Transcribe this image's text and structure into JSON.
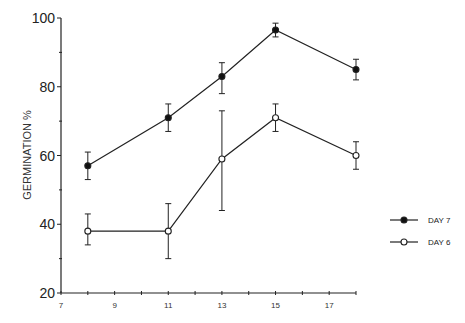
{
  "chart_data": {
    "type": "line",
    "title": "",
    "xlabel": "",
    "ylabel": "GERMINATION %",
    "xlim": [
      7,
      18
    ],
    "ylim": [
      20,
      100
    ],
    "x_ticks": [
      7,
      9,
      11,
      13,
      15,
      17
    ],
    "y_ticks": [
      20,
      40,
      60,
      80,
      100
    ],
    "y_minor_ticks": [
      30,
      50,
      70,
      90
    ],
    "grid": false,
    "legend_position": "right",
    "x": [
      8,
      11,
      13,
      15,
      18
    ],
    "series": [
      {
        "name": "DAY 7",
        "marker": "filled-circle",
        "values": [
          57,
          71,
          83,
          96.5,
          85
        ],
        "error_upper": [
          61,
          75,
          87,
          98.5,
          88
        ],
        "error_lower": [
          53,
          67,
          78,
          94.5,
          82
        ]
      },
      {
        "name": "DAY 6",
        "marker": "open-circle",
        "values": [
          38,
          38,
          59,
          71,
          60
        ],
        "error_upper": [
          43,
          46,
          73,
          75,
          64
        ],
        "error_lower": [
          34,
          30,
          44,
          67,
          56
        ]
      }
    ]
  },
  "legend": {
    "items": [
      {
        "label": "DAY 7",
        "marker": "filled"
      },
      {
        "label": "DAY 6",
        "marker": "open"
      }
    ]
  },
  "axes": {
    "y_title": "GERMINATION %"
  }
}
